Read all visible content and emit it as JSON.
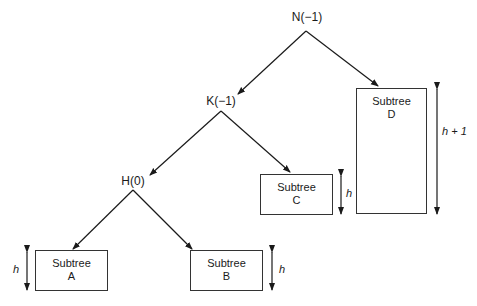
{
  "nodes": {
    "n": {
      "label": "N(−1)"
    },
    "k": {
      "label": "K(−1)"
    },
    "h": {
      "label": "H(0)"
    }
  },
  "subtrees": {
    "a": {
      "line1": "Subtree",
      "line2": "A",
      "height_label": "h"
    },
    "b": {
      "line1": "Subtree",
      "line2": "B",
      "height_label": "h"
    },
    "c": {
      "line1": "Subtree",
      "line2": "C",
      "height_label": "h"
    },
    "d": {
      "line1": "Subtree",
      "line2": "D",
      "height_label": "h + 1"
    }
  },
  "colors": {
    "line": "#1a1a1a",
    "background": "#ffffff"
  }
}
